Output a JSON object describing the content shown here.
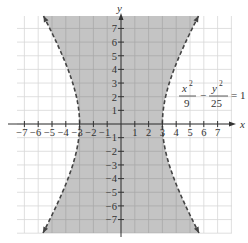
{
  "chart_data": {
    "type": "area",
    "title": "",
    "equation": {
      "lhs_num1": "x",
      "lhs_exp1": "2",
      "lhs_den1": "9",
      "minus": "−",
      "lhs_num2": "y",
      "lhs_exp2": "2",
      "lhs_den2": "25",
      "equals": "= 1"
    },
    "xlabel": "x",
    "ylabel": "y",
    "xlim": [
      -7.5,
      7.5
    ],
    "ylim": [
      -8,
      8
    ],
    "x_ticks": [
      "−7",
      "−6",
      "−5",
      "−4",
      "−3",
      "−2",
      "−1",
      "1",
      "2",
      "3",
      "4",
      "5",
      "6",
      "7"
    ],
    "y_ticks": [
      "7",
      "6",
      "5",
      "4",
      "3",
      "2",
      "1",
      "−1",
      "−2",
      "−3",
      "−4",
      "−5",
      "−6",
      "−7"
    ],
    "x_tick_values": [
      -7,
      -6,
      -5,
      -4,
      -3,
      -2,
      -1,
      1,
      2,
      3,
      4,
      5,
      6,
      7
    ],
    "y_tick_values": [
      7,
      6,
      5,
      4,
      3,
      2,
      1,
      -1,
      -2,
      -3,
      -4,
      -5,
      -6,
      -7
    ],
    "grid": true,
    "boundary_style": "dashed",
    "a": 3,
    "b": 5,
    "colors": {
      "shade": "#c4c4c4",
      "grid": "#d8d8d8",
      "axis": "#333333",
      "curve": "#444444"
    }
  }
}
